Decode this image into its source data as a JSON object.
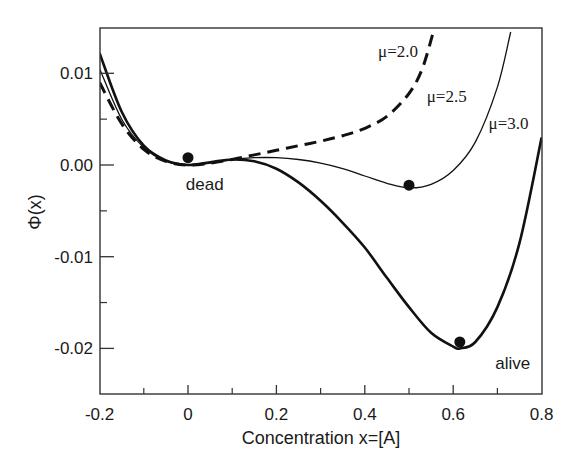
{
  "chart_data": {
    "type": "line",
    "title": "",
    "xlabel": "Concentration x=[A]",
    "ylabel": "Φ(x)",
    "xlim": [
      -0.2,
      0.8
    ],
    "ylim": [
      -0.025,
      0.0145
    ],
    "grid": false,
    "legend": "none (inline curve annotations)",
    "x_ticks": [
      -0.2,
      0,
      0.2,
      0.4,
      0.6,
      0.8
    ],
    "x_tick_labels": [
      "-0.2",
      "0",
      "0.2",
      "0.4",
      "0.6",
      "0.8"
    ],
    "x_minor_ticks": [
      -0.1,
      0.1,
      0.3,
      0.5,
      0.7
    ],
    "y_ticks": [
      0.01,
      0.0,
      -0.01,
      -0.02
    ],
    "y_tick_labels": [
      "0.01",
      "0.00",
      "-0.01",
      "-0.02"
    ],
    "y_minor_ticks": [
      0.005,
      -0.005,
      -0.015
    ],
    "series": [
      {
        "name": "μ=2.0",
        "style": "dashed",
        "line_width": 3,
        "x": [
          -0.2,
          -0.15,
          -0.1,
          -0.05,
          0.0,
          0.05,
          0.1,
          0.15,
          0.2,
          0.25,
          0.3,
          0.35,
          0.4,
          0.45,
          0.5,
          0.53,
          0.555
        ],
        "y": [
          0.009,
          0.0045,
          0.0017,
          0.0004,
          0.0,
          0.0002,
          0.0006,
          0.0011,
          0.0016,
          0.0021,
          0.0026,
          0.0032,
          0.004,
          0.0053,
          0.0078,
          0.0105,
          0.0145
        ]
      },
      {
        "name": "μ=2.5",
        "style": "solid-thin",
        "line_width": 1.3,
        "x": [
          -0.2,
          -0.15,
          -0.1,
          -0.05,
          0.0,
          0.05,
          0.1,
          0.15,
          0.2,
          0.25,
          0.3,
          0.35,
          0.4,
          0.45,
          0.5,
          0.55,
          0.6,
          0.65,
          0.7,
          0.73
        ],
        "y": [
          0.0105,
          0.005,
          0.0019,
          0.0004,
          0.0,
          0.0002,
          0.0006,
          0.0008,
          0.0008,
          0.0006,
          0.0002,
          -0.0004,
          -0.0012,
          -0.002,
          -0.0025,
          -0.0021,
          -0.0006,
          0.0025,
          0.0085,
          0.0145
        ]
      },
      {
        "name": "μ=3.0",
        "style": "solid-thick",
        "line_width": 2.6,
        "x": [
          -0.2,
          -0.15,
          -0.1,
          -0.05,
          0.0,
          0.05,
          0.1,
          0.15,
          0.2,
          0.25,
          0.3,
          0.35,
          0.4,
          0.45,
          0.5,
          0.55,
          0.6,
          0.615,
          0.65,
          0.7,
          0.75,
          0.8
        ],
        "y": [
          0.0122,
          0.0058,
          0.0021,
          0.0005,
          0.0,
          0.0003,
          0.0006,
          0.0004,
          -0.0004,
          -0.0019,
          -0.0039,
          -0.0063,
          -0.009,
          -0.0123,
          -0.0155,
          -0.0183,
          -0.0198,
          -0.02,
          -0.0193,
          -0.0155,
          -0.0085,
          0.003
        ]
      }
    ],
    "markers": [
      {
        "x": 0.0,
        "y": 0.0008,
        "note": "dead state"
      },
      {
        "x": 0.5,
        "y": -0.0022,
        "note": "μ=2.5 minimum"
      },
      {
        "x": 0.615,
        "y": -0.0193,
        "note": "alive state"
      }
    ],
    "annotations": [
      {
        "text": "μ=2.0",
        "x": 0.43,
        "y": 0.0118,
        "font": "serif"
      },
      {
        "text": "μ=2.5",
        "x": 0.54,
        "y": 0.0069,
        "font": "serif"
      },
      {
        "text": "μ=3.0",
        "x": 0.68,
        "y": 0.0039,
        "font": "serif"
      },
      {
        "text": "dead",
        "x": -0.005,
        "y": -0.0027,
        "font": "sans"
      },
      {
        "text": "alive",
        "x": 0.695,
        "y": -0.0222,
        "font": "sans"
      }
    ]
  }
}
